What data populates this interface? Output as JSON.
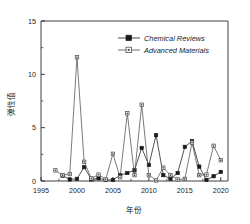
{
  "chart_data": {
    "type": "line",
    "title": "",
    "xlabel": "年份",
    "ylabel": "弹性值",
    "xlim": [
      1995,
      2021
    ],
    "ylim": [
      0,
      15
    ],
    "xticks": [
      1995,
      2000,
      2005,
      2010,
      2015,
      2020
    ],
    "yticks": [
      0,
      5,
      10,
      15
    ],
    "grid": false,
    "legend_position": "top-right",
    "legend": [
      "Chemical Reviews",
      "Advanced Materials"
    ],
    "x": [
      1997,
      1998,
      1999,
      2000,
      2001,
      2002,
      2003,
      2004,
      2005,
      2006,
      2007,
      2008,
      2009,
      2010,
      2011,
      2012,
      2013,
      2014,
      2015,
      2016,
      2017,
      2018,
      2019,
      2020
    ],
    "series": [
      {
        "name": "Chemical Reviews",
        "marker": "filled-square",
        "color": "#1a1a1a",
        "values": [
          null,
          0.5,
          0.15,
          0.2,
          1.3,
          0.15,
          0.25,
          0.1,
          0.1,
          0.55,
          0.75,
          1.0,
          3.1,
          1.5,
          4.3,
          0.55,
          0.2,
          0.75,
          3.2,
          3.75,
          1.35,
          0.1,
          0.45,
          0.85
        ]
      },
      {
        "name": "Advanced Materials",
        "marker": "open-square",
        "color": "#4d4d4d",
        "values": [
          1.0,
          0.55,
          0.65,
          11.6,
          1.8,
          0.25,
          0.6,
          0.15,
          2.55,
          0.35,
          6.35,
          0.55,
          7.15,
          0.55,
          0.05,
          1.25,
          0.55,
          0.15,
          0.2,
          3.6,
          0.55,
          0.6,
          3.3,
          1.95
        ]
      }
    ]
  },
  "axes": {
    "y_tick_labels": [
      "0",
      "5",
      "10",
      "15"
    ],
    "x_tick_labels": [
      "1995",
      "2000",
      "2005",
      "2010",
      "2015",
      "2020"
    ]
  }
}
